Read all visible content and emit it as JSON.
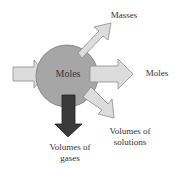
{
  "diagram": {
    "center_label": "Moles",
    "outputs": [
      {
        "label": "Masses",
        "direction": "up-right"
      },
      {
        "label": "Moles",
        "direction": "right"
      },
      {
        "label": "Volumes of solutions",
        "line1": "Volumes of",
        "line2": "solutions",
        "direction": "down-right"
      },
      {
        "label": "Volumes of gases",
        "line1": "Volumes of",
        "line2": "gases",
        "direction": "down",
        "highlighted": true
      }
    ],
    "input": {
      "direction": "from-left"
    }
  },
  "colors": {
    "circle_fill": "#a6a6a6",
    "circle_stroke": "#7a7a7a",
    "arrow_fill": "#dcdcdc",
    "arrow_stroke": "#8c8c8c",
    "highlight_arrow_fill": "#3a3a3a",
    "text": "#333333"
  }
}
